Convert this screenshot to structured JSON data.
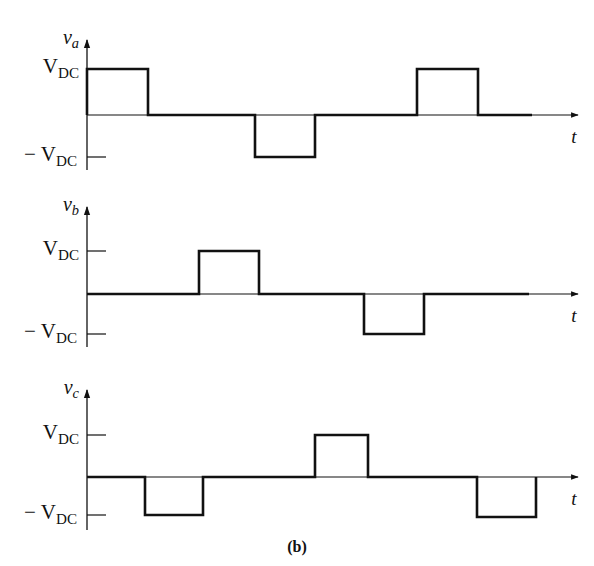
{
  "figure": {
    "caption": "(b)",
    "time_axis_label": "t",
    "level_pos_label": "V",
    "level_pos_sub": "DC",
    "level_neg_label": "− V",
    "level_neg_sub": "DC",
    "line_color": "#111111",
    "background": "#ffffff"
  },
  "panels": [
    {
      "name": "va",
      "ylabel_main": "v",
      "ylabel_sub": "a",
      "axis_x": 87,
      "zero_y": 115,
      "top_y": 69,
      "bot_y": 157,
      "axis_top": 40,
      "axis_bottom": 170,
      "arrow_end": 578,
      "waveform": [
        [
          87,
          115
        ],
        [
          87,
          69
        ],
        [
          148,
          69
        ],
        [
          148,
          115
        ],
        [
          255,
          115
        ],
        [
          255,
          157
        ],
        [
          315,
          157
        ],
        [
          315,
          115
        ],
        [
          417,
          115
        ],
        [
          417,
          69
        ],
        [
          478,
          69
        ],
        [
          478,
          115
        ],
        [
          532,
          115
        ]
      ],
      "ticks": [
        "neg"
      ]
    },
    {
      "name": "vb",
      "ylabel_main": "v",
      "ylabel_sub": "b",
      "axis_x": 87,
      "zero_y": 294,
      "top_y": 251,
      "bot_y": 334,
      "axis_top": 207,
      "axis_bottom": 347,
      "arrow_end": 578,
      "waveform": [
        [
          87,
          294
        ],
        [
          199,
          294
        ],
        [
          199,
          251
        ],
        [
          259,
          251
        ],
        [
          259,
          294
        ],
        [
          364,
          294
        ],
        [
          364,
          334
        ],
        [
          424,
          334
        ],
        [
          424,
          294
        ],
        [
          529,
          294
        ]
      ],
      "ticks": [
        "pos",
        "neg"
      ]
    },
    {
      "name": "vc",
      "ylabel_main": "v",
      "ylabel_sub": "c",
      "axis_x": 87,
      "zero_y": 477,
      "top_y": 435,
      "bot_y": 515,
      "axis_top": 390,
      "axis_bottom": 530,
      "arrow_end": 578,
      "waveform": [
        [
          87,
          477
        ],
        [
          145,
          477
        ],
        [
          145,
          515
        ],
        [
          203,
          515
        ],
        [
          203,
          477
        ],
        [
          315,
          477
        ],
        [
          315,
          435
        ],
        [
          368,
          435
        ],
        [
          368,
          477
        ],
        [
          477,
          477
        ],
        [
          477,
          517
        ],
        [
          536,
          517
        ],
        [
          536,
          477
        ]
      ],
      "ticks": [
        "pos",
        "neg"
      ]
    }
  ],
  "chart_data": {
    "type": "line",
    "title": "(b)",
    "xlabel": "t",
    "series": [
      {
        "name": "v_a",
        "levels": [
          1,
          0,
          -1,
          0,
          1,
          0
        ],
        "segment_bounds_px": [
          87,
          148,
          255,
          315,
          417,
          478,
          532
        ]
      },
      {
        "name": "v_b",
        "levels": [
          0,
          1,
          0,
          -1,
          0
        ],
        "segment_bounds_px": [
          87,
          199,
          259,
          364,
          424,
          529
        ]
      },
      {
        "name": "v_c",
        "levels": [
          0,
          -1,
          0,
          1,
          0,
          -1
        ],
        "segment_bounds_px": [
          87,
          145,
          203,
          315,
          368,
          477,
          536
        ]
      }
    ],
    "y_ticks": [
      "V_DC",
      "0",
      "-V_DC"
    ],
    "ylim": [
      -1.2,
      1.2
    ]
  }
}
